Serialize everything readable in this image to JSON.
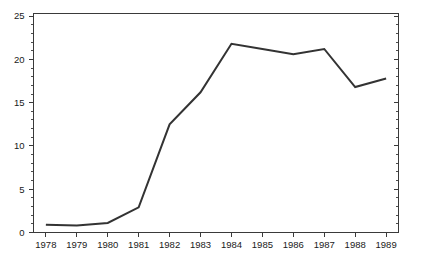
{
  "chart_data": {
    "type": "line",
    "title": "",
    "subtitle": "",
    "xlabel": "",
    "ylabel": "",
    "categories": [
      "1978",
      "1979",
      "1980",
      "1981",
      "1982",
      "1983",
      "1984",
      "1985",
      "1986",
      "1987",
      "1988",
      "1989"
    ],
    "x": [
      1978,
      1979,
      1980,
      1981,
      1982,
      1983,
      1984,
      1985,
      1986,
      1987,
      1988,
      1989
    ],
    "values": [
      0.9,
      0.8,
      1.1,
      2.9,
      12.5,
      16.2,
      21.8,
      21.2,
      20.6,
      21.2,
      16.8,
      17.8
    ],
    "series": [
      {
        "name": "",
        "values": [
          0.9,
          0.8,
          1.1,
          2.9,
          12.5,
          16.2,
          21.8,
          21.2,
          20.6,
          21.2,
          16.8,
          17.8
        ],
        "color": "#333333"
      }
    ],
    "xlim": [
      1977.6,
      1989.4
    ],
    "ylim": [
      0,
      25.3
    ],
    "y_ticks": [
      0,
      5,
      10,
      15,
      20,
      25
    ],
    "y_tick_labels": [
      "0",
      "5",
      "10",
      "15",
      "20",
      "25"
    ],
    "y_minor_step": 1,
    "x_ticks": [
      1978,
      1979,
      1980,
      1981,
      1982,
      1983,
      1984,
      1985,
      1986,
      1987,
      1988,
      1989
    ],
    "x_tick_labels": [
      "1978",
      "1979",
      "1980",
      "1981",
      "1982",
      "1983",
      "1984",
      "1985",
      "1986",
      "1987",
      "1988",
      "1989"
    ],
    "grid": false,
    "legend": null,
    "legend_position": "none",
    "annotations": [],
    "frame": "box",
    "axis_color": "#3a3a3a",
    "background_color": "#ffffff",
    "tick_direction": "out-left-bottom-in-right-top"
  }
}
